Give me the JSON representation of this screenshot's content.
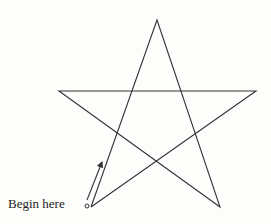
{
  "diagram": {
    "type": "pentagram-drawing-instruction",
    "start_label": "Begin here",
    "stroke_color": "#333333",
    "background_color": "#fdfdfb",
    "points": {
      "start": [
        91,
        207
      ],
      "top": [
        157,
        20
      ],
      "bottom_right": [
        220,
        207
      ],
      "left": [
        59,
        91
      ],
      "right": [
        256,
        91
      ]
    },
    "start_marker": [
      87,
      206
    ],
    "arrow": {
      "from": [
        88,
        201
      ],
      "to": [
        103,
        161
      ]
    }
  }
}
